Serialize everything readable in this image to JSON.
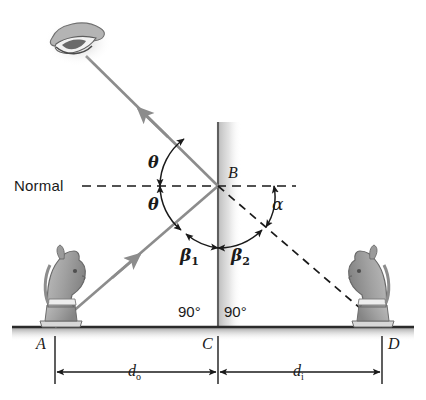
{
  "figure": {
    "domain_note": "ray diagram of object, mirror, virtual image"
  },
  "labels": {
    "normal": "Normal",
    "vertex_b": "B",
    "point_a": "A",
    "point_c": "C",
    "point_d": "D",
    "theta_upper": "θ",
    "theta_lower": "θ",
    "alpha": "α",
    "beta1_base": "β",
    "beta1_sub": "1",
    "beta2_base": "β",
    "beta2_sub": "2",
    "angle_left_90": "90°",
    "angle_right_90": "90°",
    "d_object_base": "d",
    "d_object_sub": "o",
    "d_image_base": "d",
    "d_image_sub": "i"
  },
  "icons": {
    "eye": "eye-icon",
    "object_knight": "chess-knight-object-icon",
    "image_knight": "chess-knight-image-icon"
  },
  "colors": {
    "ray": "#8c8c8c",
    "dashed": "#1a1a1a",
    "mirror": "#6e6e6e",
    "mirror_shadow": "#c9c9c9",
    "ground": "#2b2b2b",
    "text": "#1a1a1a",
    "arc": "#1a1a1a",
    "knight_body": "#a8a8a8",
    "knight_dark": "#7d7d7d",
    "knight_light": "#e4e4e4",
    "background": "#ffffff"
  },
  "geometry": {
    "point_b": [
      218,
      186
    ],
    "point_a": [
      55,
      327
    ],
    "point_c": [
      218,
      327
    ],
    "point_d": [
      382,
      327
    ],
    "eye": [
      80,
      48
    ],
    "normal_y": 186,
    "ground_y": 327,
    "mirror_x": 218,
    "mirror_top_y": 122,
    "dim_line_y": 372
  }
}
